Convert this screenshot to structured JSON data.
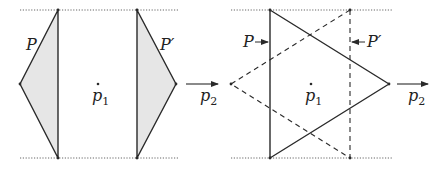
{
  "diagram": {
    "colors": {
      "stroke": "#2a2a2a",
      "fill": "#e6e6e6",
      "dotted": "#555555",
      "background": "#ffffff"
    },
    "left_panel": {
      "polygon_P": {
        "label": "P",
        "vertices": [
          [
            58,
            10
          ],
          [
            20,
            84
          ],
          [
            58,
            158
          ]
        ]
      },
      "polygon_P_prime": {
        "label": "P′",
        "vertices": [
          [
            137,
            10
          ],
          [
            176,
            84
          ],
          [
            137,
            158
          ]
        ]
      },
      "point_p1": {
        "label": "p",
        "subscript": "1",
        "pos": [
          98,
          84
        ]
      },
      "direction_p2": {
        "label": "p",
        "subscript": "2",
        "from": [
          186,
          84
        ],
        "to": [
          218,
          84
        ]
      },
      "boundary_lines_y": [
        10,
        158
      ],
      "boundary_x_range": [
        20,
        178
      ]
    },
    "right_panel": {
      "solid_triangle": {
        "vertices": [
          [
            270,
            10
          ],
          [
            389,
            84
          ],
          [
            270,
            158
          ]
        ]
      },
      "dashed_triangle": {
        "vertices": [
          [
            350,
            10
          ],
          [
            231,
            84
          ],
          [
            350,
            158
          ]
        ]
      },
      "label_P": {
        "label": "P",
        "arrow_to": [
          268,
          42
        ]
      },
      "label_P_prime": {
        "label": "P′",
        "arrow_to": [
          352,
          42
        ]
      },
      "point_p1": {
        "label": "p",
        "subscript": "1",
        "pos": [
          311,
          84
        ]
      },
      "direction_p2": {
        "label": "p",
        "subscript": "2",
        "from": [
          397,
          84
        ],
        "to": [
          428,
          84
        ]
      },
      "boundary_lines_y": [
        10,
        158
      ],
      "boundary_x_range": [
        231,
        392
      ]
    }
  }
}
